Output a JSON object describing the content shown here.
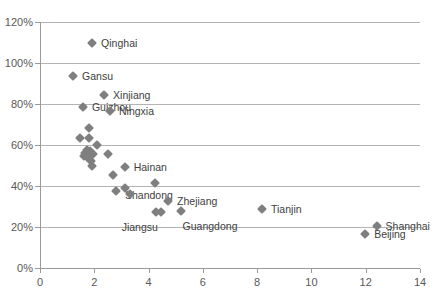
{
  "chart_data": {
    "type": "scatter",
    "title": "",
    "subtitle": "",
    "xlabel": "",
    "ylabel": "",
    "xlim": [
      0,
      14
    ],
    "ylim": [
      0,
      1.2
    ],
    "xticks": [
      "0",
      "2",
      "4",
      "6",
      "8",
      "10",
      "12",
      "14"
    ],
    "xtick_values": [
      0,
      2,
      4,
      6,
      8,
      10,
      12,
      14
    ],
    "yticks": [
      "0%",
      "20%",
      "40%",
      "60%",
      "80%",
      "100%",
      "120%"
    ],
    "ytick_values": [
      0,
      0.2,
      0.4,
      0.6,
      0.8,
      1.0,
      1.2
    ],
    "grid": "horizontal",
    "legend": "none",
    "marker_color": "#7f7f7f",
    "marker_shape": "diamond",
    "gridline_color": "#b3b3b3",
    "axis_color": "#9a9a9a",
    "tick_label_color": "#595959",
    "annotation_color": "#404040",
    "series": [
      {
        "name": "provinces",
        "points": [
          {
            "x": 1.92,
            "y": 1.1,
            "label": "Qinghai",
            "label_dx": 9,
            "label_dy": 0
          },
          {
            "x": 1.22,
            "y": 0.935,
            "label": "Gansu",
            "label_dx": 9,
            "label_dy": 0
          },
          {
            "x": 2.36,
            "y": 0.845,
            "label": "Xinjiang",
            "label_dx": 9,
            "label_dy": 0
          },
          {
            "x": 1.58,
            "y": 0.785,
            "label": "Guizhou",
            "label_dx": 9,
            "label_dy": 0
          },
          {
            "x": 2.58,
            "y": 0.765,
            "label": "Ningxia",
            "label_dx": 9,
            "label_dy": 0
          },
          {
            "x": 1.8,
            "y": 0.685,
            "label": "",
            "label_dx": 0,
            "label_dy": 0
          },
          {
            "x": 1.47,
            "y": 0.635,
            "label": "",
            "label_dx": 0,
            "label_dy": 0
          },
          {
            "x": 1.8,
            "y": 0.635,
            "label": "",
            "label_dx": 0,
            "label_dy": 0
          },
          {
            "x": 2.1,
            "y": 0.6,
            "label": "",
            "label_dx": 0,
            "label_dy": 0
          },
          {
            "x": 1.74,
            "y": 0.578,
            "label": "",
            "label_dx": 0,
            "label_dy": 0
          },
          {
            "x": 1.86,
            "y": 0.572,
            "label": "",
            "label_dx": 0,
            "label_dy": 0
          },
          {
            "x": 1.66,
            "y": 0.562,
            "label": "",
            "label_dx": 0,
            "label_dy": 0
          },
          {
            "x": 1.95,
            "y": 0.558,
            "label": "",
            "label_dx": 0,
            "label_dy": 0
          },
          {
            "x": 2.5,
            "y": 0.558,
            "label": "",
            "label_dx": 0,
            "label_dy": 0
          },
          {
            "x": 1.62,
            "y": 0.545,
            "label": "",
            "label_dx": 0,
            "label_dy": 0
          },
          {
            "x": 1.72,
            "y": 0.54,
            "label": "",
            "label_dx": 0,
            "label_dy": 0
          },
          {
            "x": 1.88,
            "y": 0.52,
            "label": "",
            "label_dx": 0,
            "label_dy": 0
          },
          {
            "x": 1.9,
            "y": 0.5,
            "label": "",
            "label_dx": 0,
            "label_dy": 0
          },
          {
            "x": 3.12,
            "y": 0.492,
            "label": "Hainan",
            "label_dx": 9,
            "label_dy": 0
          },
          {
            "x": 2.68,
            "y": 0.455,
            "label": "",
            "label_dx": 0,
            "label_dy": 0
          },
          {
            "x": 4.24,
            "y": 0.415,
            "label": "",
            "label_dx": 0,
            "label_dy": 0
          },
          {
            "x": 3.12,
            "y": 0.39,
            "label": "",
            "label_dx": 0,
            "label_dy": 0
          },
          {
            "x": 2.8,
            "y": 0.378,
            "label": "Shandong",
            "label_dx": 9,
            "label_dy": 4
          },
          {
            "x": 3.3,
            "y": 0.36,
            "label": "",
            "label_dx": 0,
            "label_dy": 0
          },
          {
            "x": 4.72,
            "y": 0.325,
            "label": "Zhejiang",
            "label_dx": 9,
            "label_dy": 0
          },
          {
            "x": 5.18,
            "y": 0.278,
            "label": "Guangdong",
            "label_dx": 2,
            "label_dy": 15
          },
          {
            "x": 4.46,
            "y": 0.275,
            "label": "",
            "label_dx": 0,
            "label_dy": 0
          },
          {
            "x": 4.26,
            "y": 0.275,
            "label": "Jiangsu",
            "label_dx": -34,
            "label_dy": 15
          },
          {
            "x": 8.18,
            "y": 0.288,
            "label": "Tianjin",
            "label_dx": 9,
            "label_dy": 0
          },
          {
            "x": 12.4,
            "y": 0.205,
            "label": "Shanghai",
            "label_dx": 9,
            "label_dy": 0
          },
          {
            "x": 11.98,
            "y": 0.168,
            "label": "Beijing",
            "label_dx": 9,
            "label_dy": 0
          }
        ]
      }
    ]
  }
}
